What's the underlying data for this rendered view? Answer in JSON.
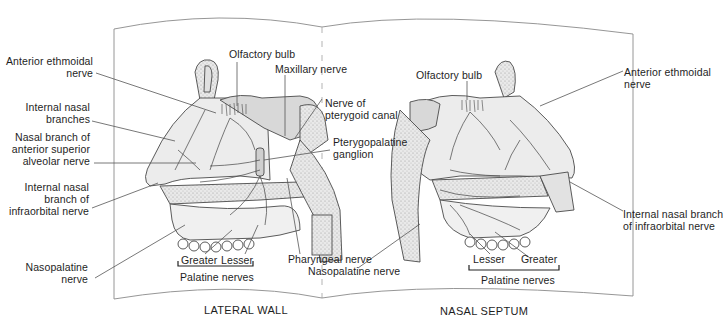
{
  "figure": {
    "panels": [
      {
        "id": "lateral-wall",
        "caption": "LATERAL WALL",
        "labels": {
          "anterior_ethmoidal_nerve": [
            "Anterior ethmoidal",
            "nerve"
          ],
          "internal_nasal_branches": [
            "Internal nasal",
            "branches"
          ],
          "nasal_branch_asa": [
            "Nasal branch of",
            "anterior superior",
            "alveolar nerve"
          ],
          "internal_nasal_branch_io": [
            "Internal nasal",
            "branch of",
            "infraorbital nerve"
          ],
          "nasopalatine_nerve": [
            "Nasopalatine",
            "nerve"
          ],
          "olfactory_bulb": "Olfactory bulb",
          "maxillary_nerve": "Maxillary nerve",
          "nerve_pterygoid_canal": [
            "Nerve of",
            "pterygoid canal"
          ],
          "pterygopalatine_ganglion": [
            "Pterygopalatine",
            "ganglion"
          ],
          "pharyngeal_nerve": "Pharyngeal nerve",
          "palatine_greater": "Greater",
          "palatine_lesser": "Lesser",
          "palatine_group": "Palatine nerves"
        }
      },
      {
        "id": "nasal-septum",
        "caption": "NASAL SEPTUM",
        "labels": {
          "olfactory_bulb": "Olfactory bulb",
          "anterior_ethmoidal_nerve": [
            "Anterior ethmoidal",
            "nerve"
          ],
          "internal_nasal_branch_io": [
            "Internal nasal branch",
            "of infraorbital nerve"
          ],
          "nasopalatine_nerve": "Nasopalatine nerve",
          "palatine_lesser": "Lesser",
          "palatine_greater": "Greater",
          "palatine_group": "Palatine nerves"
        }
      }
    ],
    "colors": {
      "line": "#555555",
      "frame": "#8a8a8a",
      "tissue_fill": "#e6e6e6",
      "bone_fill": "#d2d2d2",
      "stipple": "#9a9a9a"
    }
  }
}
